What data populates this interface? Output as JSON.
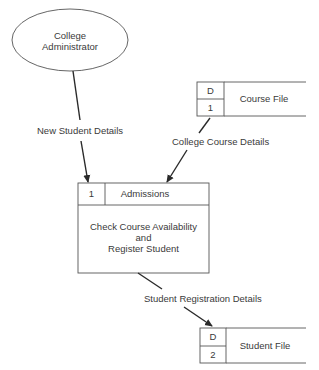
{
  "diagram": {
    "type": "data-flow-diagram",
    "colors": {
      "stroke": "#555555",
      "arrow": "#2a2a2a",
      "text": "#3a3a3a",
      "background": "#ffffff"
    },
    "external_entity": {
      "label_line1": "College",
      "label_line2": "Administrator"
    },
    "process": {
      "number": "1",
      "title": "Admissions",
      "body_line1": "Check Course Availability",
      "body_line2": "and",
      "body_line3": "Register Student"
    },
    "data_stores": [
      {
        "type": "D",
        "number": "1",
        "name": "Course File"
      },
      {
        "type": "D",
        "number": "2",
        "name": "Student File"
      }
    ],
    "flows": [
      {
        "label": "New Student Details",
        "from": "College Administrator",
        "to": "Admissions"
      },
      {
        "label": "College Course Details",
        "from": "Course File",
        "to": "Admissions"
      },
      {
        "label": "Student Registration Details",
        "from": "Admissions",
        "to": "Student File"
      }
    ]
  }
}
